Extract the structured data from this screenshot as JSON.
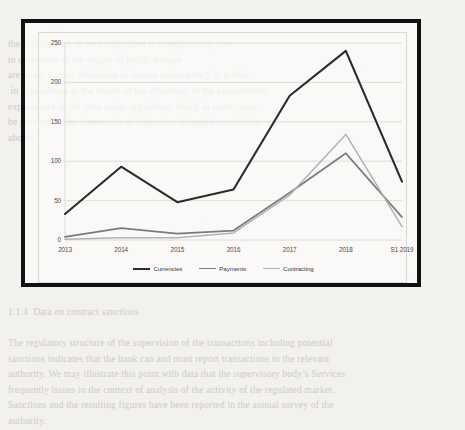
{
  "document": {
    "background_text_top": "the significance of such regulation is comparatively low.\nto contribute to the degree of public budget\nare under a strict obligation to ensure transparency in public\n in expenditure as the object of the efficiency of the procurement\nexpenditure of the state under regulation, which in some cases\nbe pursued in the framework of other, less stringent constraints\nabove.",
    "background_text_mid": "1.1.4  Data on contract sanctions\n\nThe regulatory structure of the supervision of the transactions including potential\nsanctions indicates that the bank can and must report transactions to the relevant\nauthority. We may illustrate this point with data that the supervisory body’s Services\nfrequently issues in the context of analysis of the activity of the regulated market.\nSanctions and the resulting figures have been reported in the annual survey of the\nauthority."
  },
  "chart_data": {
    "type": "line",
    "title": "",
    "xlabel": "",
    "ylabel": "",
    "categories": [
      "2013",
      "2014",
      "2015",
      "2016",
      "2017",
      "2018",
      "S1 2019"
    ],
    "ylim": [
      0,
      250
    ],
    "yticks": [
      0,
      50,
      100,
      150,
      200,
      250
    ],
    "grid": true,
    "legend_position": "bottom",
    "series": [
      {
        "name": "Currencies",
        "color": "#2b2b2b",
        "width": 2.1,
        "values": [
          33,
          93,
          48,
          64,
          183,
          240,
          74
        ]
      },
      {
        "name": "Payments",
        "color": "#7b7b7b",
        "width": 1.7,
        "values": [
          4,
          15,
          8,
          12,
          60,
          110,
          29
        ]
      },
      {
        "name": "Contracting",
        "color": "#b3b3b3",
        "width": 1.5,
        "values": [
          1,
          3,
          3,
          9,
          57,
          134,
          17
        ]
      }
    ]
  },
  "colors": {
    "frame": "#111111",
    "gridline": "#d7d5d1",
    "axis_text": "#4a4a4a",
    "page": "#f2f1ee"
  }
}
